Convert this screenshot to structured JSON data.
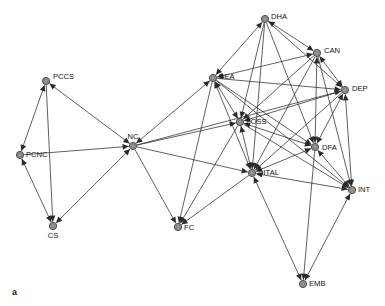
{
  "figure": {
    "panel_letter": "a",
    "type": "directed-network-graph",
    "background_color": "#ffffff",
    "node_fill_color": "#9a9a9a",
    "node_stroke_color": "#3d3d3d",
    "edge_color": "#2b2b2b",
    "label_color": "#111111",
    "node_radius": 3.6
  },
  "graph": {
    "nodes": [
      {
        "id": "PCCS",
        "label": "PCCS",
        "x": 46,
        "y": 81,
        "label_dx": 7,
        "label_dy": -4
      },
      {
        "id": "PCNC",
        "label": "PCNC",
        "x": 20,
        "y": 155,
        "label_dx": 6,
        "label_dy": 0
      },
      {
        "id": "CS",
        "label": "CS",
        "x": 53,
        "y": 226,
        "label_dx": 0,
        "label_dy": 10
      },
      {
        "id": "NC",
        "label": "NC",
        "x": 133,
        "y": 146,
        "label_dx": 0,
        "label_dy": -9
      },
      {
        "id": "DEA",
        "label": "DEA",
        "x": 213,
        "y": 78,
        "label_dx": 6,
        "label_dy": -1
      },
      {
        "id": "DHA",
        "label": "DHA",
        "x": 265,
        "y": 19,
        "label_dx": 6,
        "label_dy": -2
      },
      {
        "id": "CAN",
        "label": "CAN",
        "x": 317,
        "y": 53,
        "label_dx": 7,
        "label_dy": -2
      },
      {
        "id": "DEP",
        "label": "DEP",
        "x": 345,
        "y": 90,
        "label_dx": 7,
        "label_dy": -1
      },
      {
        "id": "FOSS",
        "label": "FOSS",
        "x": 240,
        "y": 122,
        "label_dx": 6,
        "label_dy": 0
      },
      {
        "id": "DFA",
        "label": "DFA",
        "x": 315,
        "y": 147,
        "label_dx": 7,
        "label_dy": 1
      },
      {
        "id": "DITAL",
        "label": "DITAL",
        "x": 252,
        "y": 173,
        "label_dx": 6,
        "label_dy": 0
      },
      {
        "id": "INT",
        "label": "INT",
        "x": 352,
        "y": 190,
        "label_dx": 6,
        "label_dy": 0
      },
      {
        "id": "FC",
        "label": "FC",
        "x": 178,
        "y": 227,
        "label_dx": 6,
        "label_dy": 1
      },
      {
        "id": "EMB",
        "label": "EMB",
        "x": 303,
        "y": 284,
        "label_dx": 6,
        "label_dy": 0
      }
    ],
    "edges": [
      {
        "from": "PCNC",
        "to": "PCCS",
        "arrows": "both"
      },
      {
        "from": "PCCS",
        "to": "CS",
        "arrows": "to"
      },
      {
        "from": "PCNC",
        "to": "CS",
        "arrows": "both"
      },
      {
        "from": "PCCS",
        "to": "NC",
        "arrows": "both"
      },
      {
        "from": "PCNC",
        "to": "NC",
        "arrows": "to"
      },
      {
        "from": "CS",
        "to": "NC",
        "arrows": "both"
      },
      {
        "from": "NC",
        "to": "DEA",
        "arrows": "both"
      },
      {
        "from": "NC",
        "to": "FOSS",
        "arrows": "to"
      },
      {
        "from": "NC",
        "to": "DITAL",
        "arrows": "to"
      },
      {
        "from": "NC",
        "to": "FC",
        "arrows": "to"
      },
      {
        "from": "NC",
        "to": "DEP",
        "arrows": "to"
      },
      {
        "from": "DEA",
        "to": "DHA",
        "arrows": "both"
      },
      {
        "from": "DEA",
        "to": "CAN",
        "arrows": "both"
      },
      {
        "from": "DEA",
        "to": "DEP",
        "arrows": "to"
      },
      {
        "from": "DEA",
        "to": "FOSS",
        "arrows": "both"
      },
      {
        "from": "DEA",
        "to": "DFA",
        "arrows": "to"
      },
      {
        "from": "DEA",
        "to": "DITAL",
        "arrows": "both"
      },
      {
        "from": "DEA",
        "to": "INT",
        "arrows": "to"
      },
      {
        "from": "DEA",
        "to": "FC",
        "arrows": "to"
      },
      {
        "from": "DHA",
        "to": "CAN",
        "arrows": "both"
      },
      {
        "from": "DHA",
        "to": "DEP",
        "arrows": "to"
      },
      {
        "from": "DHA",
        "to": "FOSS",
        "arrows": "to"
      },
      {
        "from": "DHA",
        "to": "DFA",
        "arrows": "to"
      },
      {
        "from": "DHA",
        "to": "DITAL",
        "arrows": "to"
      },
      {
        "from": "CAN",
        "to": "DEP",
        "arrows": "both"
      },
      {
        "from": "CAN",
        "to": "FOSS",
        "arrows": "to"
      },
      {
        "from": "CAN",
        "to": "DFA",
        "arrows": "both"
      },
      {
        "from": "CAN",
        "to": "DITAL",
        "arrows": "to"
      },
      {
        "from": "CAN",
        "to": "INT",
        "arrows": "to"
      },
      {
        "from": "DEP",
        "to": "FOSS",
        "arrows": "to"
      },
      {
        "from": "DEP",
        "to": "DFA",
        "arrows": "both"
      },
      {
        "from": "DEP",
        "to": "DITAL",
        "arrows": "to"
      },
      {
        "from": "DEP",
        "to": "INT",
        "arrows": "both"
      },
      {
        "from": "FOSS",
        "to": "DFA",
        "arrows": "both"
      },
      {
        "from": "FOSS",
        "to": "DITAL",
        "arrows": "both"
      },
      {
        "from": "FOSS",
        "to": "INT",
        "arrows": "to"
      },
      {
        "from": "FOSS",
        "to": "FC",
        "arrows": "to"
      },
      {
        "from": "DFA",
        "to": "DITAL",
        "arrows": "both"
      },
      {
        "from": "DFA",
        "to": "INT",
        "arrows": "both"
      },
      {
        "from": "DFA",
        "to": "EMB",
        "arrows": "to"
      },
      {
        "from": "DITAL",
        "to": "INT",
        "arrows": "both"
      },
      {
        "from": "DITAL",
        "to": "EMB",
        "arrows": "both"
      },
      {
        "from": "DITAL",
        "to": "FC",
        "arrows": "to"
      },
      {
        "from": "INT",
        "to": "EMB",
        "arrows": "both"
      }
    ]
  }
}
